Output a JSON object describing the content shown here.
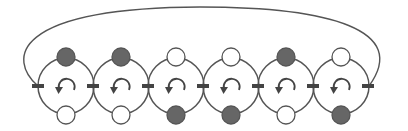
{
  "diagram": {
    "title": "",
    "colors": {
      "stroke": "#555555",
      "filled_node": "#666666",
      "empty_node": "#ffffff",
      "junction": "#444444"
    },
    "loop_arc": {
      "description": "closing arc connecting leftmost junction to rightmost junction"
    },
    "rings": [
      {
        "index": 1,
        "top_node": "filled",
        "bottom_node": "empty",
        "rotation": "counterclockwise-arrow"
      },
      {
        "index": 2,
        "top_node": "filled",
        "bottom_node": "empty",
        "rotation": "counterclockwise-arrow"
      },
      {
        "index": 3,
        "top_node": "empty",
        "bottom_node": "filled",
        "rotation": "counterclockwise-arrow"
      },
      {
        "index": 4,
        "top_node": "empty",
        "bottom_node": "filled",
        "rotation": "counterclockwise-arrow"
      },
      {
        "index": 5,
        "top_node": "filled",
        "bottom_node": "empty",
        "rotation": "counterclockwise-arrow"
      },
      {
        "index": 6,
        "top_node": "empty",
        "bottom_node": "filled",
        "rotation": "counterclockwise-arrow"
      }
    ],
    "junction_count": 7
  }
}
